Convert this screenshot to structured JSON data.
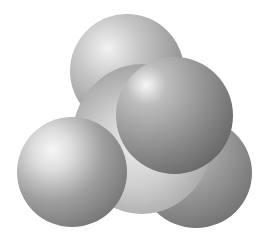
{
  "image": {
    "subject": "space-filling molecular model",
    "style": "grayscale shaded spheres",
    "background": "#ffffff",
    "spheres": [
      {
        "name": "top-sphere",
        "shade": "#c8c8c8"
      },
      {
        "name": "bottom-right-sphere",
        "shade": "#9c9c9c"
      },
      {
        "name": "central-body",
        "shade": "#cfcfcf"
      },
      {
        "name": "left-sphere",
        "shade": "#9e9e9e"
      },
      {
        "name": "front-right-sphere",
        "shade": "#8f8f8f"
      }
    ]
  }
}
